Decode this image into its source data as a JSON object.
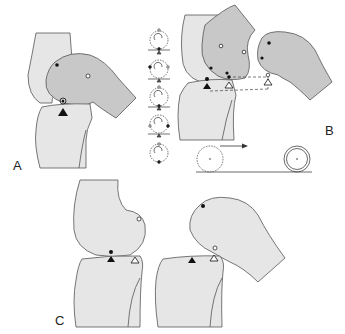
{
  "figure": {
    "panels": [
      {
        "id": "A",
        "label": "A"
      },
      {
        "id": "B",
        "label": "B"
      },
      {
        "id": "C",
        "label": "C"
      }
    ],
    "legend_markers": {
      "filled_circle": "contact point on femur",
      "open_circle": "reference point on femur",
      "filled_triangle": "contact point on tibia",
      "open_triangle": "reference point on tibia"
    },
    "colors": {
      "bone_light": "#e6e6e6",
      "bone_dark": "#c8c8c8",
      "outline": "#555555",
      "marker": "#111111",
      "background": "#ffffff"
    }
  }
}
